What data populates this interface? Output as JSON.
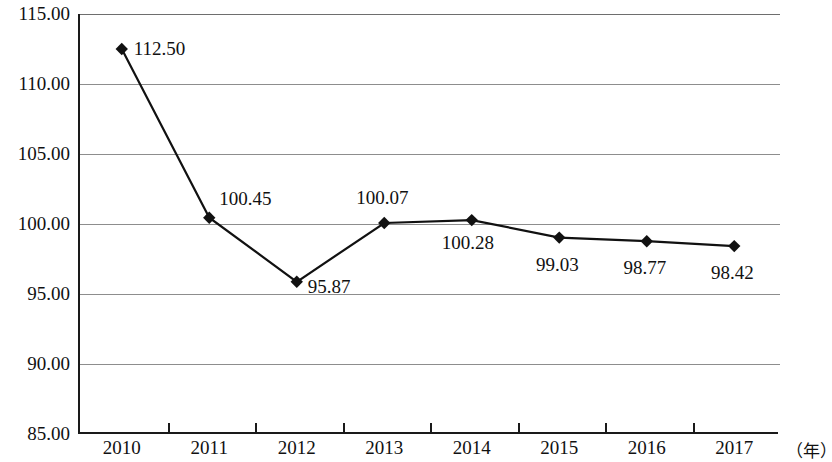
{
  "chart_data": {
    "type": "line",
    "title": "",
    "xlabel": "（年）",
    "ylabel": "",
    "categories": [
      "2010",
      "2011",
      "2012",
      "2013",
      "2014",
      "2015",
      "2016",
      "2017"
    ],
    "values": [
      112.5,
      100.45,
      95.87,
      100.07,
      100.28,
      99.03,
      98.77,
      98.42
    ],
    "data_labels": [
      "112.50",
      "100.45",
      "95.87",
      "100.07",
      "100.28",
      "99.03",
      "98.77",
      "98.42"
    ],
    "ylim": [
      85.0,
      115.0
    ],
    "ytick_labels": [
      "115.00",
      "110.00",
      "105.00",
      "100.00",
      "95.00",
      "90.00",
      "85.00"
    ],
    "ytick_values": [
      115,
      110,
      105,
      100,
      95,
      90,
      85
    ],
    "grid": true,
    "legend": null,
    "marker": "diamond",
    "series_color": "#111111",
    "grid_color": "#8d8d8d",
    "axis_color": "#1a1a1a"
  },
  "axis": {
    "x_unit_label": "（年）"
  }
}
